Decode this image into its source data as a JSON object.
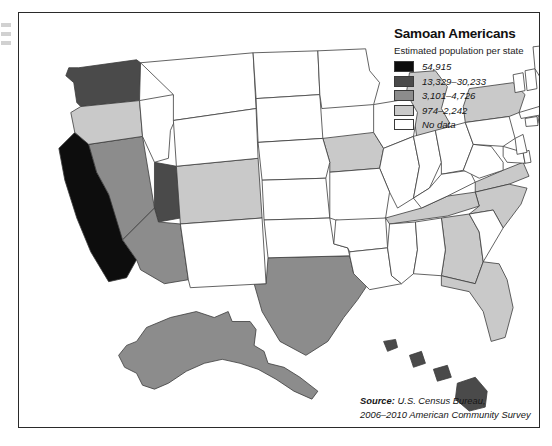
{
  "figure": {
    "kind": "choropleth-map",
    "region": "United States"
  },
  "legend": {
    "title": "Samoan Americans",
    "subtitle": "Estimated population per state",
    "entries": [
      {
        "label": "54,915",
        "color": "#0d0d0d",
        "name": "swatch-highest"
      },
      {
        "label": "13,329–30,233",
        "color": "#4a4a4a",
        "name": "swatch-high"
      },
      {
        "label": "3,101–4,726",
        "color": "#8c8c8c",
        "name": "swatch-medium"
      },
      {
        "label": "974–2,242",
        "color": "#c9c9c9",
        "name": "swatch-low"
      },
      {
        "label": "No data",
        "color": "#ffffff",
        "name": "swatch-nodata"
      }
    ]
  },
  "source": {
    "lead": "Source:",
    "line1": " U.S. Census Bureau,",
    "line2": "2006–2010 American Community Survey"
  },
  "chart_data": {
    "type": "choropleth",
    "title": "Samoan Americans",
    "subtitle": "Estimated population per state",
    "value_label": "Estimated population per state",
    "classes": [
      {
        "label": "54,915",
        "color": "#0d0d0d",
        "min": 54915,
        "max": 54915
      },
      {
        "label": "13,329–30,233",
        "color": "#4a4a4a",
        "min": 13329,
        "max": 30233
      },
      {
        "label": "3,101–4,726",
        "color": "#8c8c8c",
        "min": 3101,
        "max": 4726
      },
      {
        "label": "974–2,242",
        "color": "#c9c9c9",
        "min": 974,
        "max": 2242
      },
      {
        "label": "No data",
        "color": "#ffffff",
        "min": null,
        "max": null
      }
    ],
    "states": [
      {
        "code": "CA",
        "name": "California",
        "class": 0
      },
      {
        "code": "WA",
        "name": "Washington",
        "class": 1
      },
      {
        "code": "UT",
        "name": "Utah",
        "class": 1
      },
      {
        "code": "HI",
        "name": "Hawaii",
        "class": 1
      },
      {
        "code": "TX",
        "name": "Texas",
        "class": 2
      },
      {
        "code": "NV",
        "name": "Nevada",
        "class": 2
      },
      {
        "code": "AZ",
        "name": "Arizona",
        "class": 2
      },
      {
        "code": "AK",
        "name": "Alaska",
        "class": 2
      },
      {
        "code": "OR",
        "name": "Oregon",
        "class": 3
      },
      {
        "code": "CO",
        "name": "Colorado",
        "class": 3
      },
      {
        "code": "IA",
        "name": "Iowa",
        "class": 3
      },
      {
        "code": "MI",
        "name": "Michigan",
        "class": 3
      },
      {
        "code": "NY",
        "name": "New York",
        "class": 3
      },
      {
        "code": "VA",
        "name": "Virginia",
        "class": 3
      },
      {
        "code": "NC",
        "name": "North Carolina",
        "class": 3
      },
      {
        "code": "TN",
        "name": "Tennessee",
        "class": 3
      },
      {
        "code": "GA",
        "name": "Georgia",
        "class": 3
      },
      {
        "code": "FL",
        "name": "Florida",
        "class": 3
      },
      {
        "code": "ID",
        "name": "Idaho",
        "class": 4
      },
      {
        "code": "MT",
        "name": "Montana",
        "class": 4
      },
      {
        "code": "WY",
        "name": "Wyoming",
        "class": 4
      },
      {
        "code": "ND",
        "name": "North Dakota",
        "class": 4
      },
      {
        "code": "SD",
        "name": "South Dakota",
        "class": 4
      },
      {
        "code": "NE",
        "name": "Nebraska",
        "class": 4
      },
      {
        "code": "KS",
        "name": "Kansas",
        "class": 4
      },
      {
        "code": "OK",
        "name": "Oklahoma",
        "class": 4
      },
      {
        "code": "NM",
        "name": "New Mexico",
        "class": 4
      },
      {
        "code": "MN",
        "name": "Minnesota",
        "class": 4
      },
      {
        "code": "WI",
        "name": "Wisconsin",
        "class": 4
      },
      {
        "code": "IL",
        "name": "Illinois",
        "class": 4
      },
      {
        "code": "MO",
        "name": "Missouri",
        "class": 4
      },
      {
        "code": "AR",
        "name": "Arkansas",
        "class": 4
      },
      {
        "code": "LA",
        "name": "Louisiana",
        "class": 4
      },
      {
        "code": "MS",
        "name": "Mississippi",
        "class": 4
      },
      {
        "code": "AL",
        "name": "Alabama",
        "class": 4
      },
      {
        "code": "IN",
        "name": "Indiana",
        "class": 4
      },
      {
        "code": "OH",
        "name": "Ohio",
        "class": 4
      },
      {
        "code": "KY",
        "name": "Kentucky",
        "class": 4
      },
      {
        "code": "WV",
        "name": "West Virginia",
        "class": 4
      },
      {
        "code": "PA",
        "name": "Pennsylvania",
        "class": 4
      },
      {
        "code": "SC",
        "name": "South Carolina",
        "class": 4
      },
      {
        "code": "MD",
        "name": "Maryland",
        "class": 4
      },
      {
        "code": "DE",
        "name": "Delaware",
        "class": 4
      },
      {
        "code": "NJ",
        "name": "New Jersey",
        "class": 4
      },
      {
        "code": "CT",
        "name": "Connecticut",
        "class": 4
      },
      {
        "code": "RI",
        "name": "Rhode Island",
        "class": 4
      },
      {
        "code": "MA",
        "name": "Massachusetts",
        "class": 4
      },
      {
        "code": "VT",
        "name": "Vermont",
        "class": 4
      },
      {
        "code": "NH",
        "name": "New Hampshire",
        "class": 4
      },
      {
        "code": "ME",
        "name": "Maine",
        "class": 4
      }
    ]
  }
}
